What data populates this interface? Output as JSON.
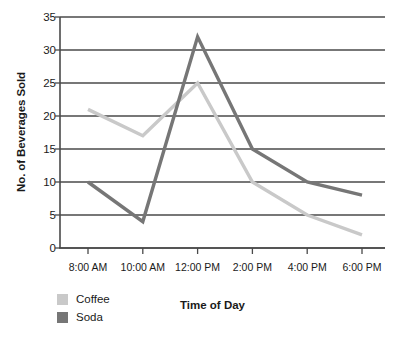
{
  "chart_data": {
    "type": "line",
    "title": "",
    "xlabel": "Time of Day",
    "ylabel": "No. of Beverages Sold",
    "categories": [
      "8:00 AM",
      "10:00 AM",
      "12:00 PM",
      "2:00 PM",
      "4:00 PM",
      "6:00 PM"
    ],
    "series": [
      {
        "name": "Coffee",
        "color": "#c9c9c9",
        "values": [
          21,
          17,
          25,
          10,
          5,
          2
        ]
      },
      {
        "name": "Soda",
        "color": "#767676",
        "values": [
          10,
          4,
          32,
          15,
          10,
          8
        ]
      }
    ],
    "ylim": [
      0,
      35
    ],
    "yticks": [
      0,
      5,
      10,
      15,
      20,
      25,
      30,
      35
    ],
    "ytick_labels": [
      "0",
      "5",
      "10",
      "15",
      "20",
      "25",
      "30",
      "35"
    ],
    "grid": true,
    "grid_color": "#4a4a4a",
    "axis_color": "#4a4a4a",
    "legend_position": "below-left"
  },
  "legend": {
    "items": [
      {
        "label": "Coffee",
        "color": "#c9c9c9"
      },
      {
        "label": "Soda",
        "color": "#767676"
      }
    ]
  },
  "axes": {
    "x_title": "Time of Day",
    "y_title": "No. of Beverages Sold"
  }
}
